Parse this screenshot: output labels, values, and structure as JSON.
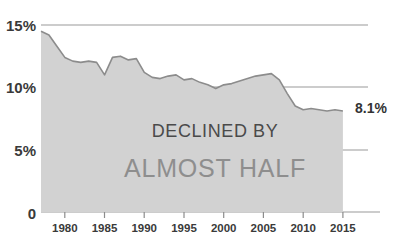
{
  "chart_data": {
    "type": "area",
    "title": "",
    "subtitle": "",
    "xlabel": "",
    "ylabel": "",
    "xlim": [
      1977,
      2015
    ],
    "ylim": [
      0,
      15
    ],
    "grid": true,
    "legend": null,
    "y_ticks": [
      {
        "value": 0,
        "label": "0"
      },
      {
        "value": 5,
        "label": "5%"
      },
      {
        "value": 10,
        "label": "10%"
      },
      {
        "value": 15,
        "label": "15%"
      }
    ],
    "x_ticks": [
      {
        "value": 1980,
        "label": "1980"
      },
      {
        "value": 1985,
        "label": "1985"
      },
      {
        "value": 1990,
        "label": "1990"
      },
      {
        "value": 1995,
        "label": "1995"
      },
      {
        "value": 2000,
        "label": "2000"
      },
      {
        "value": 2005,
        "label": "2005"
      },
      {
        "value": 2010,
        "label": "2010"
      },
      {
        "value": 2015,
        "label": "2015"
      }
    ],
    "x": [
      1977,
      1978,
      1979,
      1980,
      1981,
      1982,
      1983,
      1984,
      1985,
      1986,
      1987,
      1988,
      1989,
      1990,
      1991,
      1992,
      1993,
      1994,
      1995,
      1996,
      1997,
      1998,
      1999,
      2000,
      2001,
      2002,
      2003,
      2004,
      2005,
      2006,
      2007,
      2008,
      2009,
      2010,
      2011,
      2012,
      2013,
      2014,
      2015
    ],
    "values": [
      14.5,
      14.2,
      13.3,
      12.4,
      12.1,
      12.0,
      12.1,
      12.0,
      11.0,
      12.4,
      12.5,
      12.2,
      12.3,
      11.2,
      10.8,
      10.7,
      10.9,
      11.0,
      10.6,
      10.7,
      10.4,
      10.2,
      9.9,
      10.2,
      10.3,
      10.5,
      10.7,
      10.9,
      11.0,
      11.1,
      10.6,
      9.5,
      8.5,
      8.2,
      8.3,
      8.2,
      8.1,
      8.2,
      8.1
    ],
    "series": [
      {
        "name": "rate",
        "fill_color": "#d2d2d2",
        "line_color": "#8c8c8c",
        "values": [
          14.5,
          14.2,
          13.3,
          12.4,
          12.1,
          12.0,
          12.1,
          12.0,
          11.0,
          12.4,
          12.5,
          12.2,
          12.3,
          11.2,
          10.8,
          10.7,
          10.9,
          11.0,
          10.6,
          10.7,
          10.4,
          10.2,
          9.9,
          10.2,
          10.3,
          10.5,
          10.7,
          10.9,
          11.0,
          11.1,
          10.6,
          9.5,
          8.5,
          8.2,
          8.3,
          8.2,
          8.1,
          8.2,
          8.1
        ]
      }
    ],
    "annotations": [
      {
        "name": "endpoint-value",
        "text": "8.1%",
        "x": 2015,
        "y": 8.1
      },
      {
        "name": "overlay-line-1",
        "text": "DECLINED BY"
      },
      {
        "name": "overlay-line-2",
        "text": "ALMOST HALF"
      }
    ],
    "colors": {
      "area_fill": "#d2d2d2",
      "line": "#8c8c8c",
      "gridline": "#9a9a9a",
      "axis_text": "#3a3a3a",
      "overlay_primary": "#4a4a4a",
      "overlay_secondary": "#8e8e8e",
      "background": "#ffffff"
    }
  }
}
